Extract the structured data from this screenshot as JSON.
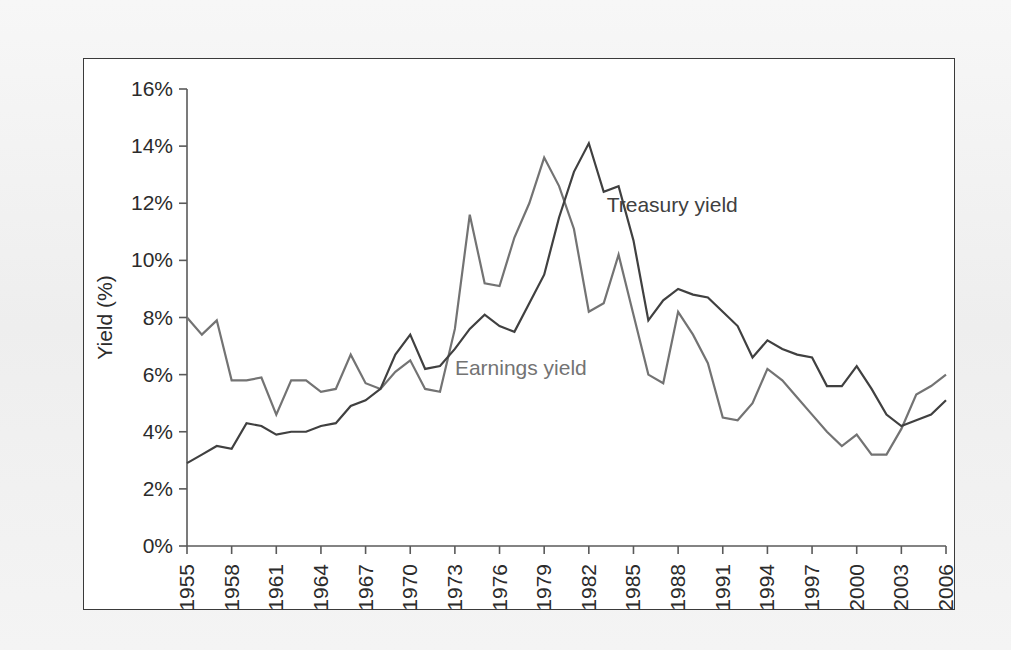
{
  "chart_data": {
    "type": "line",
    "title": "",
    "xlabel": "",
    "ylabel": "Yield (%)",
    "xlim": [
      1955,
      2006
    ],
    "ylim": [
      0,
      16
    ],
    "y_tick_values": [
      0,
      2,
      4,
      6,
      8,
      10,
      12,
      14,
      16
    ],
    "y_tick_labels": [
      "0%",
      "2%",
      "4%",
      "6%",
      "8%",
      "10%",
      "12%",
      "14%",
      "16%"
    ],
    "x_tick_values": [
      1955,
      1958,
      1961,
      1964,
      1967,
      1970,
      1973,
      1976,
      1979,
      1982,
      1985,
      1988,
      1991,
      1994,
      1997,
      2000,
      2003,
      2006
    ],
    "x_tick_labels": [
      "1955",
      "1958",
      "1961",
      "1964",
      "1967",
      "1970",
      "1973",
      "1976",
      "1979",
      "1982",
      "1985",
      "1988",
      "1991",
      "1994",
      "1997",
      "2000",
      "2003",
      "2006"
    ],
    "grid": false,
    "legend_position": "inline-annotation",
    "x": [
      1955,
      1956,
      1957,
      1958,
      1959,
      1960,
      1961,
      1962,
      1963,
      1964,
      1965,
      1966,
      1967,
      1968,
      1969,
      1970,
      1971,
      1972,
      1973,
      1974,
      1975,
      1976,
      1977,
      1978,
      1979,
      1980,
      1981,
      1982,
      1983,
      1984,
      1985,
      1986,
      1987,
      1988,
      1989,
      1990,
      1991,
      1992,
      1993,
      1994,
      1995,
      1996,
      1997,
      1998,
      1999,
      2000,
      2001,
      2002,
      2003,
      2004,
      2005,
      2006
    ],
    "series": [
      {
        "name": "Earnings yield",
        "color": "#737373",
        "values": [
          8.0,
          7.4,
          7.9,
          5.8,
          5.8,
          5.9,
          4.6,
          5.8,
          5.8,
          5.4,
          5.5,
          6.7,
          5.7,
          5.5,
          6.1,
          6.5,
          5.5,
          5.4,
          7.6,
          11.6,
          9.2,
          9.1,
          10.8,
          12.0,
          13.6,
          12.6,
          11.1,
          8.2,
          8.5,
          10.2,
          8.1,
          6.0,
          5.7,
          8.2,
          7.4,
          6.4,
          4.5,
          4.4,
          5.0,
          6.2,
          5.8,
          5.2,
          4.6,
          4.0,
          3.5,
          3.9,
          3.2,
          3.2,
          4.1,
          5.3,
          5.6,
          6.0
        ]
      },
      {
        "name": "Treasury yield",
        "color": "#404040",
        "values": [
          2.9,
          3.2,
          3.5,
          3.4,
          4.3,
          4.2,
          3.9,
          4.0,
          4.0,
          4.2,
          4.3,
          4.9,
          5.1,
          5.5,
          6.7,
          7.4,
          6.2,
          6.3,
          6.9,
          7.6,
          8.1,
          7.7,
          7.5,
          8.5,
          9.5,
          11.5,
          13.1,
          14.1,
          12.4,
          12.6,
          10.7,
          7.9,
          8.6,
          9.0,
          8.8,
          8.7,
          8.2,
          7.7,
          6.6,
          7.2,
          6.9,
          6.7,
          6.6,
          5.6,
          5.6,
          6.3,
          5.5,
          4.6,
          4.2,
          4.4,
          4.6,
          5.1
        ]
      }
    ],
    "annotations": [
      {
        "text": "Treasury yield",
        "x": 1983.2,
        "y": 11.7,
        "color": "#404040"
      },
      {
        "text": "Earnings yield",
        "x": 1973.0,
        "y": 6.0,
        "color": "#737373"
      }
    ]
  }
}
